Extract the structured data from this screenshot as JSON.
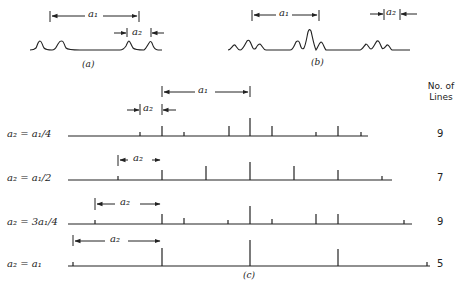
{
  "panel_a": {
    "caption": "(a)",
    "arrow_a1": "a₁",
    "arrow_a2": "a₂"
  },
  "panel_b": {
    "caption": "(b)",
    "arrow_a1": "a₁",
    "arrow_a2": "a₂"
  },
  "panel_c": {
    "caption": "(c)",
    "header_line1": "No. of",
    "header_line2": "Lines",
    "top_arrow_a1": "a₁",
    "top_arrow_a2": "a₂",
    "rows": [
      {
        "label": "a₂ = a₁/4",
        "count": "9",
        "arrow_label": "",
        "baseline": [
          68,
          368
        ],
        "y": 136,
        "lines": [
          {
            "x": 140,
            "h": 4
          },
          {
            "x": 162,
            "h": 10
          },
          {
            "x": 184,
            "h": 4
          },
          {
            "x": 229,
            "h": 10
          },
          {
            "x": 250,
            "h": 18
          },
          {
            "x": 272,
            "h": 10
          },
          {
            "x": 316,
            "h": 4
          },
          {
            "x": 338,
            "h": 10
          },
          {
            "x": 361,
            "h": 4
          }
        ]
      },
      {
        "label": "a₂ = a₁/2",
        "count": "7",
        "arrow_label": "a₂",
        "baseline": [
          68,
          392
        ],
        "y": 180,
        "lines": [
          {
            "x": 118,
            "h": 4
          },
          {
            "x": 162,
            "h": 10
          },
          {
            "x": 206,
            "h": 14
          },
          {
            "x": 250,
            "h": 18
          },
          {
            "x": 294,
            "h": 14
          },
          {
            "x": 338,
            "h": 10
          },
          {
            "x": 382,
            "h": 4
          }
        ]
      },
      {
        "label": "a₂ = 3a₁/4",
        "count": "9",
        "arrow_label": "a₂",
        "baseline": [
          68,
          412
        ],
        "y": 224,
        "lines": [
          {
            "x": 95,
            "h": 4
          },
          {
            "x": 162,
            "h": 10
          },
          {
            "x": 184,
            "h": 6
          },
          {
            "x": 228,
            "h": 4
          },
          {
            "x": 250,
            "h": 18
          },
          {
            "x": 272,
            "h": 5
          },
          {
            "x": 316,
            "h": 10
          },
          {
            "x": 338,
            "h": 10
          },
          {
            "x": 404,
            "h": 4
          }
        ]
      },
      {
        "label": "a₂ = a₁",
        "count": "5",
        "arrow_label": "a₂",
        "baseline": [
          68,
          430
        ],
        "y": 266,
        "lines": [
          {
            "x": 73,
            "h": 4
          },
          {
            "x": 162,
            "h": 18
          },
          {
            "x": 250,
            "h": 26
          },
          {
            "x": 338,
            "h": 17
          },
          {
            "x": 427,
            "h": 4
          }
        ]
      }
    ]
  },
  "colors": {
    "ink": "#222222",
    "background": "#ffffff"
  }
}
